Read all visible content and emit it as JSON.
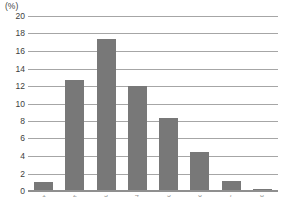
{
  "chart": {
    "unit_label": "(%)",
    "y_ticks": [
      "20",
      "18",
      "16",
      "14",
      "12",
      "10",
      "8",
      "6",
      "4",
      "2",
      "0"
    ],
    "bar_color": "#787878",
    "gridline_color": "#a6a6a6",
    "text_color": "#3d3d3d"
  },
  "chart_data": {
    "type": "bar",
    "title": "",
    "subtitle": "",
    "xlabel": "",
    "ylabel": "(%)",
    "ylim": [
      0,
      20
    ],
    "ytick_step": 2,
    "grid": true,
    "legend": "none",
    "categories": [
      "1",
      "2",
      "3",
      "4",
      "5",
      "6",
      "7",
      "8"
    ],
    "values": [
      1.0,
      12.7,
      17.4,
      12.0,
      8.3,
      4.5,
      1.2,
      0.2
    ],
    "tick_labels": [
      "20",
      "18",
      "16",
      "14",
      "12",
      "10",
      "8",
      "6",
      "4",
      "2",
      "0"
    ],
    "annotations": []
  }
}
